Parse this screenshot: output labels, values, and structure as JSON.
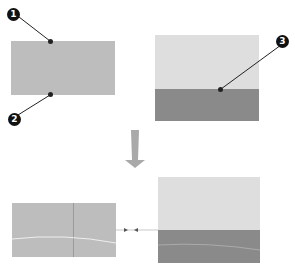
{
  "diagram": {
    "callouts": [
      {
        "number": "1",
        "target": "top edge of left rectangle"
      },
      {
        "number": "2",
        "target": "bottom edge of left rectangle"
      },
      {
        "number": "3",
        "target": "dark lower band of right rectangle"
      }
    ],
    "step_arrow": "down-arrow",
    "colors": {
      "mid_gray": "#bdbdbd",
      "light_gray": "#dedede",
      "dark_gray": "#8a8a8a",
      "callout": "#111111"
    }
  }
}
